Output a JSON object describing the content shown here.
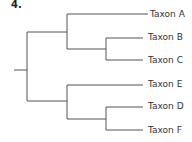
{
  "question_number": "4.",
  "tree": {
    "taxa": [
      "Taxon A",
      "Taxon B",
      "Taxon C",
      "Taxon E",
      "Taxon D",
      "Taxon F"
    ],
    "newick": "((Taxon A,(Taxon B,Taxon C)),(Taxon E,(Taxon D,Taxon F)));",
    "line_color": "#555555"
  }
}
